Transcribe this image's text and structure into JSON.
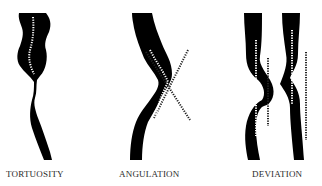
{
  "diagram": {
    "panels": [
      {
        "id": "tortuosity",
        "label": "TORTUOSITY"
      },
      {
        "id": "angulation",
        "label": "ANGULATION"
      },
      {
        "id": "deviation",
        "label": "DEVIATION"
      }
    ],
    "colors": {
      "vessel": "#000000",
      "centerline": "#ffffff",
      "axis_line": "#222222",
      "label": "#2a2a2a",
      "background": "#ffffff"
    }
  }
}
